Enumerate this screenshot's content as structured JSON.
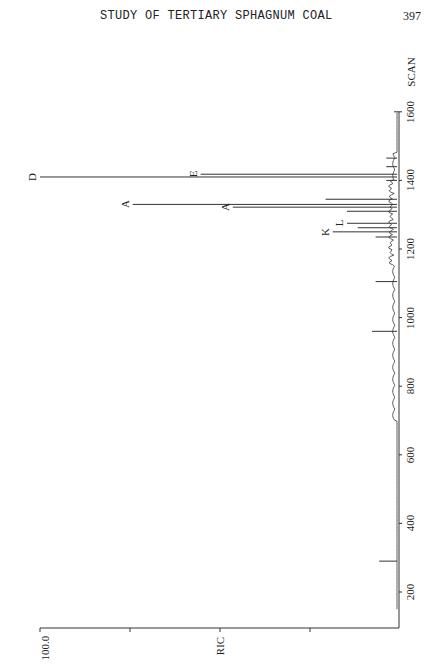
{
  "page": {
    "header": "STUDY OF TERTIARY SPHAGNUM COAL",
    "page_number": "397"
  },
  "chart_data": {
    "type": "line",
    "title": "",
    "orientation": "rotated 90° (scan axis vertical, intensity extending left)",
    "xlabel": "SCAN",
    "ylabel": "RIC",
    "x_ticks": [
      200,
      400,
      600,
      800,
      1000,
      1200,
      1400,
      1600
    ],
    "xlim": [
      150,
      1600
    ],
    "y_tick_labels": [
      "100.0"
    ],
    "ylim": [
      0,
      100
    ],
    "grid": false,
    "peaks": [
      {
        "scan": 290,
        "intensity": 5,
        "label": ""
      },
      {
        "scan": 960,
        "intensity": 7,
        "label": ""
      },
      {
        "scan": 1105,
        "intensity": 6,
        "label": ""
      },
      {
        "scan": 1235,
        "intensity": 6,
        "label": ""
      },
      {
        "scan": 1250,
        "intensity": 18,
        "label": "K"
      },
      {
        "scan": 1262,
        "intensity": 11,
        "label": ""
      },
      {
        "scan": 1275,
        "intensity": 14,
        "label": "L"
      },
      {
        "scan": 1310,
        "intensity": 14,
        "label": ""
      },
      {
        "scan": 1322,
        "intensity": 46,
        "label": "A"
      },
      {
        "scan": 1330,
        "intensity": 74,
        "label": "A"
      },
      {
        "scan": 1345,
        "intensity": 20,
        "label": ""
      },
      {
        "scan": 1400,
        "intensity": 3,
        "label": ""
      },
      {
        "scan": 1410,
        "intensity": 100,
        "label": "D"
      },
      {
        "scan": 1418,
        "intensity": 55,
        "label": "E"
      },
      {
        "scan": 1440,
        "intensity": 3,
        "label": ""
      },
      {
        "scan": 1465,
        "intensity": 3,
        "label": ""
      }
    ]
  }
}
